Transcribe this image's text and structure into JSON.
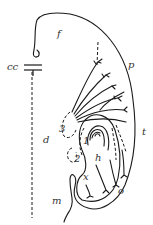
{
  "diagram": {
    "labels": {
      "f": "f",
      "cc": "cc",
      "p": "p",
      "d": "d",
      "t": "t",
      "n3": "3",
      "n1": "1",
      "n2": "2",
      "h": "h",
      "x": "x",
      "o": "o",
      "m": "m"
    },
    "stroke_color": "#1a1a1a"
  }
}
